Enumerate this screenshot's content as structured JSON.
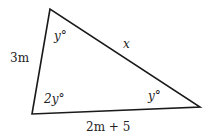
{
  "diagram": {
    "type": "triangle",
    "vertices": {
      "top": [
        50,
        9
      ],
      "bottom_left": [
        32,
        114
      ],
      "right": [
        200,
        107
      ]
    },
    "sides": {
      "left": "3m",
      "top_right": "x",
      "bottom": "2m + 5"
    },
    "angles": {
      "top": "y°",
      "bottom_left": "2y°",
      "right": "y°"
    },
    "stroke_color": "#1a1a1a",
    "background": "#ffffff"
  }
}
